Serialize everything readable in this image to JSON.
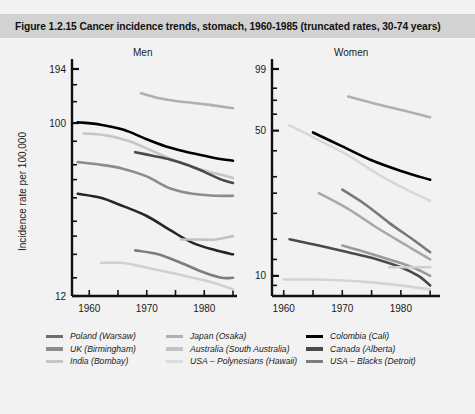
{
  "figure": {
    "title": "Figure 1.2.15   Cancer incidence trends, stomach, 1960-1985 (truncated rates, 30-74 years)",
    "band_color": "#d2d2d2",
    "background": "#f2f2f2"
  },
  "axis": {
    "ylabel": "Incidence rate per 100,000"
  },
  "legend": {
    "columns": [
      {
        "items": [
          {
            "label": "Poland (Warsaw)",
            "color": "#6e6e6e"
          },
          {
            "label": "UK (Birmingham)",
            "color": "#8c8c8c"
          },
          {
            "label": "India (Bombay)",
            "color": "#c6c6c6"
          }
        ]
      },
      {
        "items": [
          {
            "label": "Japan (Osaka)",
            "color": "#b0b0b0"
          },
          {
            "label": "Australia (South Australia)",
            "color": "#c2c2c2"
          },
          {
            "label": "USA – Polynesians (Hawaii)",
            "color": "#dcdcdc"
          }
        ]
      },
      {
        "items": [
          {
            "label": "Colombia (Cali)",
            "color": "#000000"
          },
          {
            "label": "Canada (Alberta)",
            "color": "#4a4a4a"
          },
          {
            "label": "USA – Blacks (Detroit)",
            "color": "#7d7d7d"
          }
        ]
      }
    ]
  },
  "chart_data": {
    "type": "line",
    "title": "Cancer incidence trends, stomach, 1960-1985 (truncated rates, 30-74 years)",
    "xlabel": "",
    "ylabel": "Incidence rate per 100,000",
    "yscale": "log",
    "grid": false,
    "legend_position": "bottom",
    "panels": [
      {
        "name": "Men",
        "ylim": [
          12,
          194
        ],
        "yticks": [
          12,
          100,
          194
        ],
        "ytick_labels": [
          "12",
          "100",
          "194"
        ],
        "xlim": [
          1957,
          1985
        ],
        "xticks": [
          1960,
          1965,
          1970,
          1975,
          1980,
          1985
        ],
        "xtick_labels": [
          "1960",
          "",
          "1970",
          "",
          "1980",
          ""
        ],
        "series": [
          {
            "name": "Japan (Osaka)",
            "color": "#b0b0b0",
            "x": [
              1969,
              1972,
              1975,
              1978,
              1981,
              1985
            ],
            "y": [
              144,
              136,
              131,
              128,
              125,
              120
            ]
          },
          {
            "name": "Poland (Warsaw)",
            "color": "#000000",
            "x": [
              1958,
              1962,
              1966,
              1970,
              1974,
              1978,
              1982,
              1985
            ],
            "y": [
              101,
              98,
              92,
              82,
              74,
              69,
              65,
              63
            ]
          },
          {
            "name": "UK (Birmingham)",
            "color": "#c6c6c6",
            "x": [
              1959,
              1963,
              1967,
              1971,
              1975,
              1979,
              1983,
              1985
            ],
            "y": [
              88,
              86,
              80,
              71,
              63,
              57,
              53,
              51
            ]
          },
          {
            "name": "Colombia (Cali)",
            "color": "#4a4a4a",
            "x": [
              1968,
              1971,
              1974,
              1977,
              1980,
              1983,
              1985
            ],
            "y": [
              70,
              67,
              64,
              60,
              55,
              50,
              48
            ]
          },
          {
            "name": "Canada (Alberta)",
            "color": "#8c8c8c",
            "x": [
              1958,
              1962,
              1966,
              1970,
              1974,
              1978,
              1982,
              1985
            ],
            "y": [
              62,
              60,
              57,
              52,
              45,
              42,
              41,
              41
            ]
          },
          {
            "name": "USA – Blacks (Detroit)",
            "color": "#262626",
            "x": [
              1958,
              1962,
              1966,
              1970,
              1974,
              1978,
              1982,
              1985
            ],
            "y": [
              42,
              40,
              36,
              32,
              27,
              23,
              21,
              20
            ]
          },
          {
            "name": "Australia (South Australia)",
            "color": "#c2c2c2",
            "x": [
              1976,
              1979,
              1982,
              1985
            ],
            "y": [
              24,
              24,
              24,
              25
            ]
          },
          {
            "name": "USA – Polynesians (Hawaii)",
            "color": "#7d7d7d",
            "x": [
              1968,
              1972,
              1976,
              1980,
              1983,
              1985
            ],
            "y": [
              21,
              20,
              18,
              16,
              15,
              15
            ]
          },
          {
            "name": "India (Bombay)",
            "color": "#d0d0d0",
            "x": [
              1962,
              1966,
              1970,
              1974,
              1978,
              1982,
              1985
            ],
            "y": [
              18,
              18,
              17,
              16,
              15,
              14,
              13
            ]
          }
        ]
      },
      {
        "name": "Women",
        "ylim": [
          8,
          99
        ],
        "yticks": [
          10,
          50,
          99
        ],
        "ytick_labels": [
          "10",
          "50",
          "99"
        ],
        "xlim": [
          1958,
          1986
        ],
        "xticks": [
          1960,
          1965,
          1970,
          1975,
          1980,
          1985
        ],
        "xtick_labels": [
          "1960",
          "",
          "1970",
          "",
          "1980",
          ""
        ],
        "series": [
          {
            "name": "Japan (Osaka)",
            "color": "#b0b0b0",
            "x": [
              1971,
              1976,
              1981,
              1985
            ],
            "y": [
              73,
              67,
              62,
              58
            ]
          },
          {
            "name": "UK (Birmingham)",
            "color": "#d8d8d8",
            "x": [
              1961,
              1966,
              1971,
              1976,
              1981,
              1985
            ],
            "y": [
              53,
              45,
              38,
              31,
              26,
              23
            ]
          },
          {
            "name": "Colombia (Cali)",
            "color": "#000000",
            "x": [
              1965,
              1970,
              1975,
              1980,
              1985
            ],
            "y": [
              49,
              42,
              36,
              32,
              29
            ]
          },
          {
            "name": "Canada (Alberta)",
            "color": "#787878",
            "x": [
              1970,
              1974,
              1978,
              1982,
              1985
            ],
            "y": [
              26,
              22,
              18,
              15,
              13
            ]
          },
          {
            "name": "Poland (Warsaw)",
            "color": "#a8a8a8",
            "x": [
              1966,
              1971,
              1976,
              1981,
              1985
            ],
            "y": [
              25,
              21,
              17,
              14,
              12
            ]
          },
          {
            "name": "USA – Blacks (Detroit)",
            "color": "#4a4a4a",
            "x": [
              1961,
              1966,
              1971,
              1976,
              1980,
              1983,
              1985
            ],
            "y": [
              15,
              14,
              13,
              12,
              11,
              10,
              9
            ]
          },
          {
            "name": "Australia (South Australia)",
            "color": "#9a9a9a",
            "x": [
              1970,
              1974,
              1978,
              1982,
              1985
            ],
            "y": [
              14,
              13,
              12,
              11,
              10
            ]
          },
          {
            "name": "USA – Polynesians (Hawaii)",
            "color": "#cfcfcf",
            "x": [
              1978,
              1981,
              1985
            ],
            "y": [
              11,
              11,
              11
            ]
          },
          {
            "name": "India (Bombay)",
            "color": "#d4d4d4",
            "x": [
              1960,
              1965,
              1970,
              1975,
              1980,
              1985
            ],
            "y": [
              9.6,
              9.6,
              9.5,
              9.3,
              9.0,
              8.6
            ]
          }
        ]
      }
    ]
  }
}
